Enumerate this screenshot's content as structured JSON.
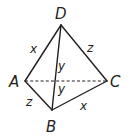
{
  "diagram": {
    "type": "tetrahedron",
    "vertices": {
      "D": {
        "label": "D"
      },
      "A": {
        "label": "A"
      },
      "B": {
        "label": "B"
      },
      "C": {
        "label": "C"
      }
    },
    "edges": [
      {
        "from": "A",
        "to": "D",
        "label": "x",
        "style": "solid"
      },
      {
        "from": "D",
        "to": "C",
        "label": "z",
        "style": "solid"
      },
      {
        "from": "D",
        "to": "B",
        "label": "y",
        "style": "solid"
      },
      {
        "from": "A",
        "to": "C",
        "label": "y",
        "style": "dashed"
      },
      {
        "from": "A",
        "to": "B",
        "label": "z",
        "style": "solid"
      },
      {
        "from": "B",
        "to": "C",
        "label": "x",
        "style": "solid"
      }
    ],
    "colors": {
      "stroke": "#231f20",
      "background": "#ffffff"
    }
  }
}
